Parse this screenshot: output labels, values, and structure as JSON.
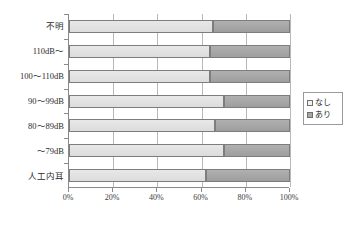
{
  "chart_data": {
    "type": "bar",
    "subtype": "stacked-horizontal-100-percent",
    "title": "",
    "xlabel": "",
    "ylabel": "",
    "categories": [
      "不明",
      "110dB～",
      "100～110dB",
      "90～99dB",
      "80～89dB",
      "～79dB",
      "人工内耳"
    ],
    "series": [
      {
        "name": "なし",
        "color": "#e2e2e2",
        "values": [
          65,
          64,
          64,
          70,
          66,
          70,
          62
        ]
      },
      {
        "name": "あり",
        "color": "#a8a8a8",
        "values": [
          35,
          36,
          36,
          30,
          34,
          30,
          38
        ]
      }
    ],
    "xlim": [
      0,
      100
    ],
    "xticks": [
      0,
      20,
      40,
      60,
      80,
      100
    ],
    "xticklabels": [
      "0%",
      "20%",
      "40%",
      "60%",
      "80%",
      "100%"
    ],
    "grid": true,
    "grid_axis": "x",
    "legend_position": "right"
  },
  "legend": {
    "items": [
      {
        "label": "なし",
        "swatch": "legend-swatch-nashi"
      },
      {
        "label": "あり",
        "swatch": "legend-swatch-ari"
      }
    ]
  }
}
